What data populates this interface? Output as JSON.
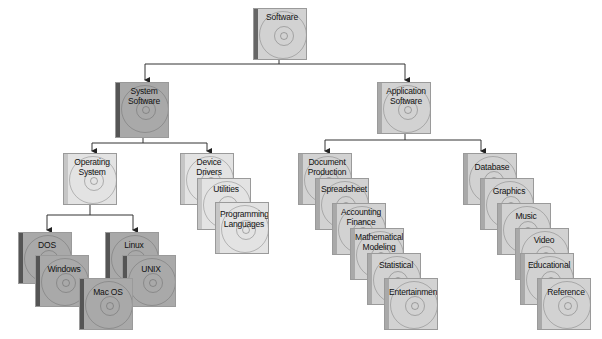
{
  "title": "Software",
  "nodes": {
    "software": "Software",
    "system_software": "System Software",
    "application_software": "Application Software",
    "operating_system": "Operating System",
    "device_drivers": "Device Drivers",
    "utilities": "Utilities",
    "programming_languages": "Programming Languages",
    "dos": "DOS",
    "windows": "Windows",
    "mac_os": "Mac OS",
    "linux": "Linux",
    "unix": "UNIX",
    "document_production": "Document Production",
    "spreadsheet": "Spreadsheet",
    "accounting_finance": "Accounting Finance",
    "mathematical_modeling": "Mathematical Modeling",
    "statistical": "Statistical",
    "entertainment": "Entertainment",
    "database": "Database",
    "graphics": "Graphics",
    "music": "Music",
    "video": "Video",
    "educational": "Educational",
    "reference": "Reference"
  },
  "colors": {
    "connector": "#333333",
    "dark_fill": "#a9a9a9",
    "light_fill": "#d2d2d2",
    "pale_fill": "#e3e3e3"
  }
}
